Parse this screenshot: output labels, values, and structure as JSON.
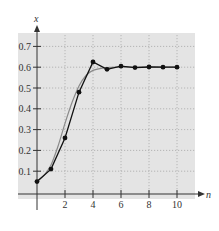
{
  "chart_data": {
    "type": "line",
    "title": "",
    "xlabel": "n",
    "ylabel": "x",
    "xlim": [
      0,
      11
    ],
    "ylim": [
      0,
      0.75
    ],
    "grid": true,
    "x_ticks": [
      "2",
      "4",
      "6",
      "8",
      "10"
    ],
    "y_ticks": [
      "0.1",
      "0.2",
      "0.3",
      "0.4",
      "0.5",
      "0.6",
      "0.7"
    ],
    "series": [
      {
        "name": "iterates",
        "style": "black line with dot markers",
        "x": [
          0,
          1,
          2,
          3,
          4,
          5,
          6,
          7,
          8,
          9,
          10
        ],
        "values": [
          0.05,
          0.11,
          0.26,
          0.48,
          0.625,
          0.59,
          0.605,
          0.598,
          0.601,
          0.6,
          0.6
        ]
      },
      {
        "name": "smooth curve",
        "style": "gray smooth line",
        "x": [
          0,
          0.5,
          1,
          1.5,
          2,
          2.5,
          3,
          3.5,
          4,
          5,
          6,
          8,
          10
        ],
        "values": [
          0.05,
          0.08,
          0.13,
          0.22,
          0.33,
          0.43,
          0.51,
          0.56,
          0.585,
          0.598,
          0.6,
          0.6,
          0.6
        ]
      }
    ]
  },
  "colors": {
    "plot_background": "#e4e4e4",
    "grid": "#a8a8a8",
    "axis": "#333333",
    "series_iterates": "#111111",
    "series_smooth": "#8a8a8a"
  }
}
